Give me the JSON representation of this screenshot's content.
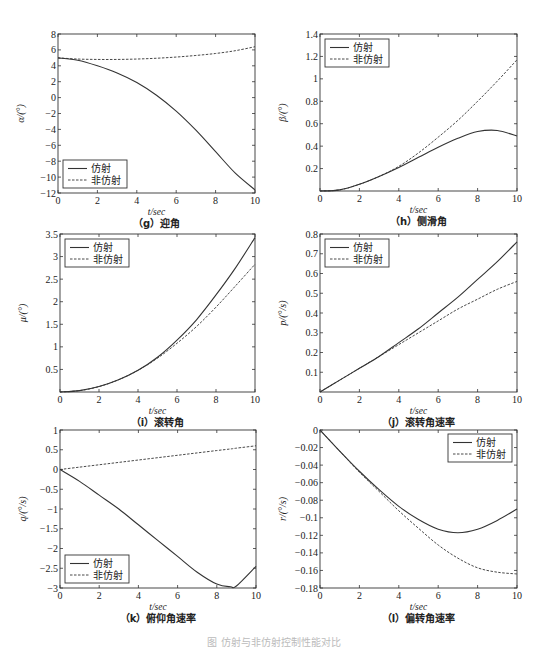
{
  "figure": {
    "caption": "图  仿射与非仿射控制性能对比"
  },
  "legend": {
    "affine": "仿射",
    "non_affine": "非仿射"
  },
  "chart_data": [
    {
      "id": "g",
      "type": "line",
      "caption": "（g）迎角",
      "xlabel": "t/sec",
      "ylabel": "α/(°)",
      "xlim": [
        0,
        10
      ],
      "ylim": [
        -12,
        8
      ],
      "xticks": [
        0,
        2,
        4,
        6,
        8,
        10
      ],
      "yticks": [
        -12,
        -10,
        -8,
        -6,
        -4,
        -2,
        0,
        2,
        4,
        6,
        8
      ],
      "legend_position": "lower-left",
      "frame": {
        "left": 58,
        "top": 34,
        "right": 255,
        "bottom": 193
      },
      "x": [
        0,
        1,
        2,
        3,
        4,
        5,
        6,
        7,
        8,
        9,
        10
      ],
      "series": [
        {
          "name": "仿射",
          "style": "solid",
          "values": [
            5.0,
            4.7,
            4.0,
            3.1,
            1.9,
            0.3,
            -1.7,
            -4.1,
            -6.8,
            -9.5,
            -11.6
          ]
        },
        {
          "name": "非仿射",
          "style": "dashed",
          "values": [
            5.0,
            4.85,
            4.8,
            4.8,
            4.85,
            4.95,
            5.1,
            5.3,
            5.55,
            5.9,
            6.4
          ]
        }
      ]
    },
    {
      "id": "h",
      "type": "line",
      "caption": "（h）侧滑角",
      "xlabel": "t/sec",
      "ylabel": "β/(°)",
      "xlim": [
        0,
        10
      ],
      "ylim": [
        0,
        1.4
      ],
      "xticks": [
        0,
        2,
        4,
        6,
        8,
        10
      ],
      "yticks": [
        0.2,
        0.4,
        0.6,
        0.8,
        1,
        1.2,
        1.4
      ],
      "legend_position": "upper-left",
      "frame": {
        "left": 320,
        "top": 34,
        "right": 517,
        "bottom": 191
      },
      "x": [
        0,
        1,
        2,
        3,
        4,
        5,
        6,
        7,
        8,
        9,
        10
      ],
      "series": [
        {
          "name": "仿射",
          "style": "solid",
          "values": [
            0.0,
            0.01,
            0.06,
            0.13,
            0.21,
            0.3,
            0.39,
            0.47,
            0.53,
            0.54,
            0.49
          ]
        },
        {
          "name": "非仿射",
          "style": "dashed",
          "values": [
            0.0,
            0.01,
            0.06,
            0.13,
            0.22,
            0.34,
            0.48,
            0.63,
            0.8,
            0.98,
            1.17
          ]
        }
      ]
    },
    {
      "id": "i",
      "type": "line",
      "caption": "（i）滚转角",
      "xlabel": "t/sec",
      "ylabel": "μ/(°)",
      "xlim": [
        0,
        10
      ],
      "ylim": [
        0,
        3.5
      ],
      "xticks": [
        0,
        2,
        4,
        6,
        8,
        10
      ],
      "yticks": [
        0.5,
        1,
        1.5,
        2,
        2.5,
        3,
        3.5
      ],
      "legend_position": "upper-left",
      "frame": {
        "left": 60,
        "top": 234,
        "right": 255,
        "bottom": 392
      },
      "x": [
        0,
        1,
        2,
        3,
        4,
        5,
        6,
        7,
        8,
        9,
        10
      ],
      "series": [
        {
          "name": "仿射",
          "style": "solid",
          "values": [
            0.0,
            0.03,
            0.12,
            0.27,
            0.48,
            0.77,
            1.15,
            1.6,
            2.15,
            2.75,
            3.42
          ]
        },
        {
          "name": "非仿射",
          "style": "dashed",
          "values": [
            0.0,
            0.03,
            0.12,
            0.27,
            0.48,
            0.75,
            1.08,
            1.45,
            1.88,
            2.35,
            2.83
          ]
        }
      ]
    },
    {
      "id": "j",
      "type": "line",
      "caption": "（j）滚转角速率",
      "xlabel": "t/sec",
      "ylabel": "p/(°/s)",
      "xlim": [
        0,
        10
      ],
      "ylim": [
        0,
        0.8
      ],
      "xticks": [
        0,
        2,
        4,
        6,
        8,
        10
      ],
      "yticks": [
        0.1,
        0.2,
        0.3,
        0.4,
        0.5,
        0.6,
        0.7,
        0.8
      ],
      "legend_position": "upper-left",
      "frame": {
        "left": 320,
        "top": 234,
        "right": 517,
        "bottom": 392
      },
      "x": [
        0,
        1,
        2,
        3,
        4,
        5,
        6,
        7,
        8,
        9,
        10
      ],
      "series": [
        {
          "name": "仿射",
          "style": "solid",
          "values": [
            0.0,
            0.06,
            0.12,
            0.18,
            0.25,
            0.32,
            0.4,
            0.48,
            0.57,
            0.66,
            0.76
          ]
        },
        {
          "name": "非仿射",
          "style": "dashed",
          "values": [
            0.0,
            0.06,
            0.12,
            0.18,
            0.24,
            0.3,
            0.36,
            0.42,
            0.47,
            0.52,
            0.56
          ]
        }
      ]
    },
    {
      "id": "k",
      "type": "line",
      "caption": "（k）俯仰角速率",
      "xlabel": "t/sec",
      "ylabel": "q/(°/s)",
      "xlim": [
        0,
        10
      ],
      "ylim": [
        -3,
        1
      ],
      "xticks": [
        0,
        2,
        4,
        6,
        8,
        10
      ],
      "yticks": [
        -3,
        -2.5,
        -2,
        -1.5,
        -1,
        -0.5,
        0,
        0.5,
        1
      ],
      "legend_position": "lower-left",
      "frame": {
        "left": 60,
        "top": 430,
        "right": 256,
        "bottom": 588
      },
      "x": [
        0,
        1,
        2,
        3,
        4,
        5,
        6,
        7,
        8,
        8.7,
        9,
        10
      ],
      "series": [
        {
          "name": "仿射",
          "style": "solid",
          "values": [
            0.0,
            -0.3,
            -0.65,
            -1.0,
            -1.4,
            -1.8,
            -2.2,
            -2.6,
            -2.9,
            -2.97,
            -2.95,
            -2.45
          ]
        },
        {
          "name": "非仿射",
          "style": "dashed",
          "values": [
            0.0,
            0.06,
            0.12,
            0.18,
            0.24,
            0.3,
            0.36,
            0.42,
            0.48,
            0.52,
            0.54,
            0.6
          ]
        }
      ]
    },
    {
      "id": "l",
      "type": "line",
      "caption": "（l）偏转角速率",
      "xlabel": "t/sec",
      "ylabel": "r/(°/s)",
      "xlim": [
        0,
        10
      ],
      "ylim": [
        -0.18,
        0
      ],
      "xticks": [
        0,
        2,
        4,
        6,
        8,
        10
      ],
      "yticks": [
        -0.18,
        -0.16,
        -0.14,
        -0.12,
        -0.1,
        -0.08,
        -0.06,
        -0.04,
        -0.02,
        0
      ],
      "legend_position": "upper-right",
      "frame": {
        "left": 320,
        "top": 430,
        "right": 517,
        "bottom": 588
      },
      "x": [
        0,
        1,
        2,
        3,
        4,
        5,
        6,
        7,
        8,
        9,
        10
      ],
      "series": [
        {
          "name": "仿射",
          "style": "solid",
          "values": [
            0.0,
            -0.024,
            -0.047,
            -0.068,
            -0.087,
            -0.102,
            -0.113,
            -0.117,
            -0.113,
            -0.103,
            -0.09
          ]
        },
        {
          "name": "非仿射",
          "style": "dashed",
          "values": [
            0.0,
            -0.024,
            -0.048,
            -0.07,
            -0.092,
            -0.112,
            -0.131,
            -0.146,
            -0.157,
            -0.162,
            -0.164
          ]
        }
      ]
    }
  ]
}
